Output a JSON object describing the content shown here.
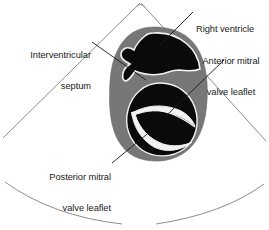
{
  "figure": {
    "type": "anatomical-diagram",
    "width": 269,
    "height": 230,
    "background_color": "#ffffff"
  },
  "colors": {
    "myocardium_gray": "#777777",
    "cavity_black": "#0a0a0a",
    "outline_white": "#f2f2f2",
    "sector_line": "#8c8c8c",
    "leader_line": "#1a1a1a",
    "text": "#1a1a1a"
  },
  "labels": [
    {
      "id": "interventricular-septum",
      "lines": [
        "Interventricular",
        "septum"
      ],
      "align": "right"
    },
    {
      "id": "right-ventricle",
      "lines": [
        "Right ventricle"
      ],
      "align": "left"
    },
    {
      "id": "anterior-mitral-valve-leaflet",
      "lines": [
        "Anterior mitral",
        "valve leaflet"
      ],
      "align": "center"
    },
    {
      "id": "posterior-mitral-valve-leaflet",
      "lines": [
        "Posterior mitral",
        "valve leaflet"
      ],
      "align": "right"
    }
  ],
  "structures": [
    {
      "id": "myocardium",
      "name": "Left ventricular myocardium",
      "fill": "#777777"
    },
    {
      "id": "right-ventricle-cavity",
      "name": "Right ventricle cavity",
      "fill": "#0a0a0a"
    },
    {
      "id": "left-ventricle-cavity",
      "name": "Left ventricle cavity",
      "fill": "#0a0a0a"
    },
    {
      "id": "anterior-leaflet",
      "name": "Anterior mitral valve leaflet",
      "fill": "#f2f2f2"
    },
    {
      "id": "posterior-leaflet",
      "name": "Posterior mitral valve leaflet",
      "fill": "#f2f2f2"
    },
    {
      "id": "ultrasound-sector",
      "name": "Ultrasound scan sector outline",
      "stroke": "#8c8c8c"
    }
  ]
}
